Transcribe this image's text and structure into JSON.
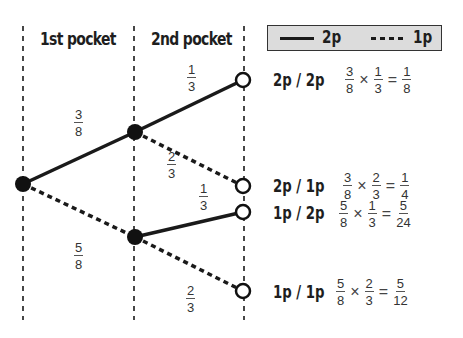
{
  "columns": {
    "first": "1st pocket",
    "second": "2nd pocket"
  },
  "legend": {
    "solid_label": "2p",
    "dotted_label": "1p",
    "solid_meaning": "2p coin",
    "dotted_meaning": "1p coin"
  },
  "colors": {
    "line": "#1a1a1a",
    "legend_fill": "#dcdcdc",
    "background": "#ffffff"
  },
  "branches": {
    "first_2p": {
      "num": "3",
      "den": "8"
    },
    "first_1p": {
      "num": "5",
      "den": "8"
    },
    "after2p_2p": {
      "num": "1",
      "den": "3"
    },
    "after2p_1p": {
      "num": "2",
      "den": "3"
    },
    "after1p_2p": {
      "num": "1",
      "den": "3"
    },
    "after1p_1p": {
      "num": "2",
      "den": "3"
    }
  },
  "outcomes": [
    {
      "label": "2p / 2p",
      "a": {
        "num": "3",
        "den": "8"
      },
      "times": "×",
      "b": {
        "num": "1",
        "den": "3"
      },
      "equals": "=",
      "result": {
        "num": "1",
        "den": "8"
      }
    },
    {
      "label": "2p / 1p",
      "a": {
        "num": "3",
        "den": "8"
      },
      "times": "×",
      "b": {
        "num": "2",
        "den": "3"
      },
      "equals": "=",
      "result": {
        "num": "1",
        "den": "4"
      }
    },
    {
      "label": "1p / 2p",
      "a": {
        "num": "5",
        "den": "8"
      },
      "times": "×",
      "b": {
        "num": "1",
        "den": "3"
      },
      "equals": "=",
      "result": {
        "num": "5",
        "den": "24"
      }
    },
    {
      "label": "1p / 1p",
      "a": {
        "num": "5",
        "den": "8"
      },
      "times": "×",
      "b": {
        "num": "2",
        "den": "3"
      },
      "equals": "=",
      "result": {
        "num": "5",
        "den": "12"
      }
    }
  ]
}
